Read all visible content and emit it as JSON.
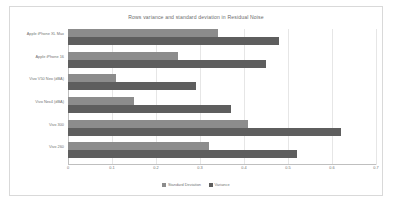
{
  "chart_data": {
    "type": "bar",
    "orientation": "horizontal",
    "title": "Rows variance and standard deviation in Residual Noise",
    "xlabel": "",
    "ylabel": "",
    "xlim": [
      0,
      0.7
    ],
    "grid": true,
    "legend_position": "bottom",
    "xticks": [
      "0",
      "0.1",
      "0.2",
      "0.3",
      "0.4",
      "0.5",
      "0.6",
      "0.7"
    ],
    "xtick_values": [
      0,
      0.1,
      0.2,
      0.3,
      0.4,
      0.5,
      0.6,
      0.7
    ],
    "categories": [
      "Apple iPhone XL Max",
      "Apple iPhone 16",
      "Vivo V50 Neo (dBA)",
      "Vivo Nex4 (dBA)",
      "Vivo 300",
      "Vivo 260"
    ],
    "series": [
      {
        "name": "Standard Deviation",
        "color": "#8c8c8c",
        "values": [
          0.34,
          0.25,
          0.11,
          0.15,
          0.41,
          0.32
        ]
      },
      {
        "name": "Variance",
        "color": "#5e5e5e",
        "values": [
          0.48,
          0.45,
          0.29,
          0.37,
          0.62,
          0.52
        ]
      }
    ]
  },
  "legend": {
    "items": [
      {
        "label": "Standard Deviation"
      },
      {
        "label": "Variance"
      }
    ]
  }
}
